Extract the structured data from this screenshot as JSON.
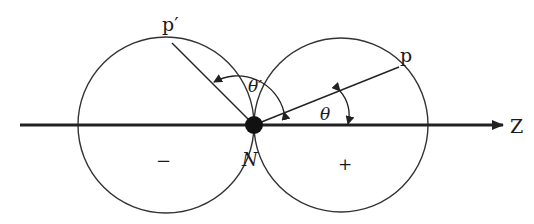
{
  "diagram": {
    "type": "polar-dipole",
    "axis": {
      "label": "Z",
      "y": 125,
      "x_start": 20,
      "x_end": 503
    },
    "nucleus": {
      "label": "N",
      "cx": 254,
      "cy": 125,
      "r": 9
    },
    "lobes": [
      {
        "name": "negative-lobe",
        "sign": "−",
        "cx": 166,
        "cy": 125,
        "r": 88,
        "sign_pos": [
          162,
          165
        ]
      },
      {
        "name": "positive-lobe",
        "sign": "+",
        "cx": 341,
        "cy": 125,
        "r": 87,
        "sign_pos": [
          343,
          169
        ]
      }
    ],
    "points": [
      {
        "name": "p",
        "label": "p",
        "x": 399,
        "y": 67,
        "label_pos": [
          398,
          64
        ]
      },
      {
        "name": "p-prime",
        "label": "p′",
        "x": 172,
        "y": 43,
        "label_pos": [
          162,
          30
        ]
      }
    ],
    "angles": [
      {
        "name": "theta",
        "label": "θ",
        "label_pos": [
          55,
          0
        ]
      },
      {
        "name": "theta-prime",
        "label": "θ′"
      }
    ],
    "colors": {
      "stroke": "#222222",
      "background": "#ffffff"
    }
  },
  "labels": {
    "p": "p",
    "p_prime": "p′",
    "theta": "θ",
    "theta_prime": "θ′",
    "z_axis": "Z",
    "nucleus": "N",
    "minus": "−",
    "plus": "+"
  }
}
